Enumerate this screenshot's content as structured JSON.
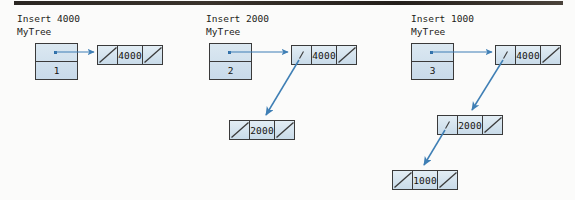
{
  "figure": {
    "background_color": "#fbfbfa",
    "node_fill_color": "#d2e2ee",
    "node_border_color": "#3a3a3a",
    "arrow_color": "#3f7fb5"
  },
  "panels": [
    {
      "id": "panel-insert-4000",
      "caption_line1": "Insert 4000",
      "caption_line2": "MyTree",
      "handle": {
        "pointer_label": "",
        "count_label": "1"
      },
      "nodes": [
        {
          "id": "node-4000",
          "key": "4000",
          "left": "null",
          "right": "null"
        }
      ]
    },
    {
      "id": "panel-insert-2000",
      "caption_line1": "Insert 2000",
      "caption_line2": "MyTree",
      "handle": {
        "pointer_label": "",
        "count_label": "2"
      },
      "nodes": [
        {
          "id": "node-4000",
          "key": "4000",
          "left": "pointer",
          "right": "null"
        },
        {
          "id": "node-2000",
          "key": "2000",
          "left": "null",
          "right": "null"
        }
      ]
    },
    {
      "id": "panel-insert-1000",
      "caption_line1": "Insert 1000",
      "caption_line2": "MyTree",
      "handle": {
        "pointer_label": "",
        "count_label": "3"
      },
      "nodes": [
        {
          "id": "node-4000",
          "key": "4000",
          "left": "pointer",
          "right": "null"
        },
        {
          "id": "node-2000",
          "key": "2000",
          "left": "pointer",
          "right": "null"
        },
        {
          "id": "node-1000",
          "key": "1000",
          "left": "null",
          "right": "null"
        }
      ]
    }
  ]
}
